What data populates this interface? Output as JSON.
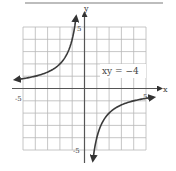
{
  "chart_data": {
    "type": "line",
    "title": "",
    "equation_label": "xy = −4",
    "xlabel": "x",
    "ylabel": "y",
    "xlim": [
      -5,
      5
    ],
    "ylim": [
      -5,
      5
    ],
    "x_tick_labels": [
      "-5",
      "5"
    ],
    "y_tick_labels": [
      "5",
      "-5"
    ],
    "grid": true,
    "grid_step": 1,
    "series": [
      {
        "name": "xy = -4 (left branch, x<0)",
        "points": [
          [
            -5.5,
            0.73
          ],
          [
            -5,
            0.8
          ],
          [
            -4,
            1.0
          ],
          [
            -3,
            1.33
          ],
          [
            -2,
            2.0
          ],
          [
            -1.5,
            2.67
          ],
          [
            -1,
            4.0
          ],
          [
            -0.8,
            5.0
          ],
          [
            -0.7,
            5.7
          ]
        ]
      },
      {
        "name": "xy = -4 (right branch, x>0)",
        "points": [
          [
            0.7,
            -5.7
          ],
          [
            0.8,
            -5.0
          ],
          [
            1,
            -4.0
          ],
          [
            1.5,
            -2.67
          ],
          [
            2,
            -2.0
          ],
          [
            3,
            -1.33
          ],
          [
            4,
            -1.0
          ],
          [
            5,
            -0.8
          ],
          [
            5.5,
            -0.73
          ]
        ]
      }
    ],
    "colors": {
      "curve": "#3a3a3a",
      "axis": "#555555",
      "grid": "#b5b5b5"
    }
  },
  "labels": {
    "x_axis": "x",
    "y_axis": "y",
    "x_min": "-5",
    "x_max": "5",
    "y_max": "5",
    "y_min": "-5",
    "equation": "xy = −4"
  }
}
